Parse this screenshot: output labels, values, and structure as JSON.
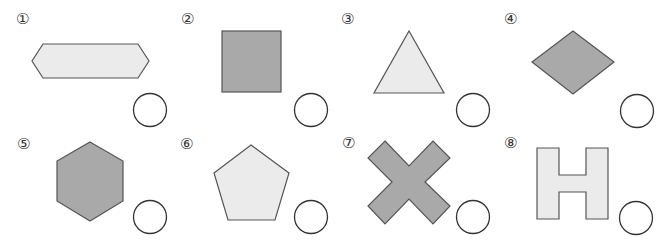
{
  "colors": {
    "dark_fill": "#a9a9a9",
    "light_fill": "#ebebeb",
    "stroke": "#555555",
    "circle_stroke": "#333333"
  },
  "items": [
    {
      "num": "①",
      "shape": "elongated-hexagon",
      "fill": "light"
    },
    {
      "num": "②",
      "shape": "square",
      "fill": "dark"
    },
    {
      "num": "③",
      "shape": "triangle",
      "fill": "light"
    },
    {
      "num": "④",
      "shape": "rhombus",
      "fill": "dark"
    },
    {
      "num": "⑤",
      "shape": "hexagon",
      "fill": "dark"
    },
    {
      "num": "⑥",
      "shape": "pentagon",
      "fill": "light"
    },
    {
      "num": "⑦",
      "shape": "x-cross",
      "fill": "dark"
    },
    {
      "num": "⑧",
      "shape": "h-letter",
      "fill": "light"
    }
  ]
}
